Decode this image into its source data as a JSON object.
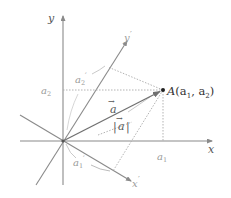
{
  "diagram": {
    "title": "",
    "axes": {
      "x_label": "x",
      "y_label": "y",
      "x_prime_label": "x",
      "y_prime_label": "y",
      "prime_mark": "′"
    },
    "point": {
      "name": "A",
      "coords_text": "(a",
      "sub1": "1",
      "sep": ", a",
      "sub2": "2",
      "close": ")"
    },
    "vector": {
      "name": "a",
      "arrow": "→",
      "magnitude_left": "|",
      "magnitude_right": "|"
    },
    "components": {
      "a1": {
        "base": "a",
        "sub": "1"
      },
      "a2": {
        "base": "a",
        "sub": "2"
      },
      "a1_prime": {
        "base": "a",
        "sub": "1",
        "prime": "′"
      },
      "a2_prime": {
        "base": "a",
        "sub": "2",
        "prime": "′"
      }
    },
    "colors": {
      "axis": "#8a8a8a",
      "vector": "#707070",
      "dotted": "#aaaaaa",
      "point": "#222222",
      "label": "#555555"
    }
  }
}
